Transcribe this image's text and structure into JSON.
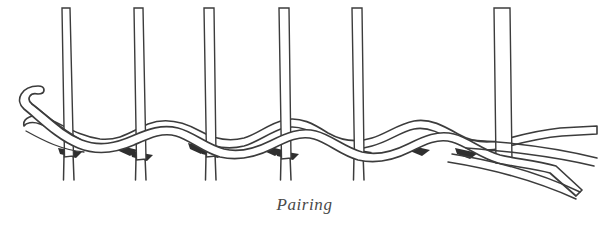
{
  "figure": {
    "caption": "Pairing",
    "background_color": "#ffffff",
    "ink_color": "#3c3c3c",
    "shadow_color": "#2f2f2f",
    "fill_color": "#ffffff",
    "canvas": {
      "width": 609,
      "height": 225
    }
  },
  "diagram": {
    "type": "line-drawing",
    "stake_count": 6,
    "weaver_count": 2,
    "stake_top_y": 8,
    "stake_bottom_y": 180,
    "weave_band_y": [
      108,
      168
    ],
    "stakes": [
      {
        "name": "stake-1",
        "x_left": 62,
        "x_right": 70,
        "top": 8,
        "bottom": 180
      },
      {
        "name": "stake-2",
        "x_left": 134,
        "x_right": 143,
        "top": 8,
        "bottom": 180
      },
      {
        "name": "stake-3",
        "x_left": 204,
        "x_right": 214,
        "top": 8,
        "bottom": 180
      },
      {
        "name": "stake-4",
        "x_left": 279,
        "x_right": 289,
        "top": 8,
        "bottom": 180
      },
      {
        "name": "stake-5",
        "x_left": 352,
        "x_right": 362,
        "top": 8,
        "bottom": 180
      },
      {
        "name": "stake-6",
        "x_left": 494,
        "x_right": 510,
        "top": 8,
        "bottom": 163
      }
    ],
    "weaver_start_left": [
      {
        "name": "upper-weaver-tip",
        "x": 36,
        "y": 93
      },
      {
        "name": "lower-weaver-tip",
        "x": 22,
        "y": 124
      }
    ],
    "weaver_end_right": [
      {
        "name": "upper-weaver-end",
        "x": 597,
        "y": 158
      },
      {
        "name": "lower-weaver-end",
        "x": 580,
        "y": 192
      }
    ],
    "shadow_wedges": 5
  }
}
